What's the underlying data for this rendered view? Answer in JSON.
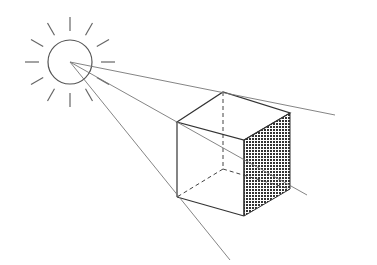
{
  "diagram": {
    "colors": {
      "background": "#ffffff",
      "stroke": "#444444",
      "ray": "#777777",
      "shade": "#333333"
    },
    "sun": {
      "cx": 70,
      "cy": 62,
      "r": 22,
      "ray_count": 12,
      "ray_inner": 31,
      "ray_outer": 45
    },
    "cube": {
      "front_top_left": [
        177,
        122
      ],
      "front_top_right": [
        244,
        140
      ],
      "front_bottom_left": [
        177,
        197
      ],
      "front_bottom_right": [
        244,
        216
      ],
      "back_top_left": [
        223,
        92
      ],
      "back_top_right": [
        290,
        113
      ],
      "back_bottom_left": [
        223,
        169
      ],
      "back_bottom_right": [
        290,
        189
      ]
    },
    "light_rays": [
      {
        "from": [
          70,
          62
        ],
        "to": [
          335,
          115
        ]
      },
      {
        "from": [
          70,
          62
        ],
        "to": [
          307,
          195
        ]
      },
      {
        "from": [
          70,
          62
        ],
        "to": [
          230,
          260
        ]
      }
    ]
  }
}
